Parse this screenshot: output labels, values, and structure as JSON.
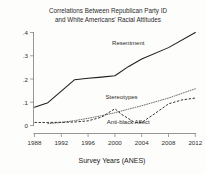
{
  "chart_data": {
    "type": "line",
    "title": "Correlations Between Republican Party ID and White Americans' Racial Attitudes",
    "title_line1": "Correlations Between Republican Party ID",
    "title_line2": "and White Americans' Racial Attitudes",
    "xlabel": "Survey Years (ANES)",
    "ylabel": "",
    "xlim": [
      1988,
      2012
    ],
    "ylim": [
      0,
      0.4
    ],
    "grid": false,
    "legend_position": "inline-annotations",
    "xticks": [
      1988,
      1992,
      1996,
      2000,
      2004,
      2008,
      2012
    ],
    "xtick_labels": [
      "1988",
      "1992",
      "1996",
      "2000",
      "2004",
      "2008",
      "2012"
    ],
    "yticks": [
      0,
      0.1,
      0.2,
      0.3,
      0.4
    ],
    "ytick_labels": [
      "0",
      ".1",
      ".2",
      ".3",
      ".4"
    ],
    "series": [
      {
        "name": "Resentment",
        "style": "solid",
        "label_x": 2002,
        "label_y": 0.345,
        "x": [
          1988,
          1990,
          1992,
          1994,
          1996,
          1998,
          2000,
          2002,
          2004,
          2008,
          2012
        ],
        "values": [
          0.079,
          0.098,
          0.148,
          0.197,
          0.203,
          0.208,
          0.214,
          0.253,
          0.286,
          0.335,
          0.4
        ]
      },
      {
        "name": "Stereotypes",
        "style": "dotted",
        "label_x": 2001,
        "label_y": 0.116,
        "x": [
          1990,
          1992,
          1994,
          1996,
          1998,
          2000,
          2002,
          2004,
          2008,
          2012
        ],
        "values": [
          0.008,
          0.013,
          0.021,
          0.031,
          0.042,
          0.055,
          0.07,
          0.085,
          0.118,
          0.158
        ]
      },
      {
        "name": "Anti-black Affect",
        "style": "dashed",
        "label_x": 2002,
        "label_y": 0.007,
        "x": [
          1988,
          1990,
          1992,
          1994,
          1996,
          1998,
          2000,
          2001,
          2003,
          2004,
          2006,
          2008,
          2010,
          2012
        ],
        "values": [
          0.013,
          0.013,
          0.014,
          0.015,
          0.02,
          0.036,
          0.072,
          0.048,
          0.012,
          0.013,
          0.052,
          0.093,
          0.11,
          0.118
        ]
      }
    ]
  }
}
